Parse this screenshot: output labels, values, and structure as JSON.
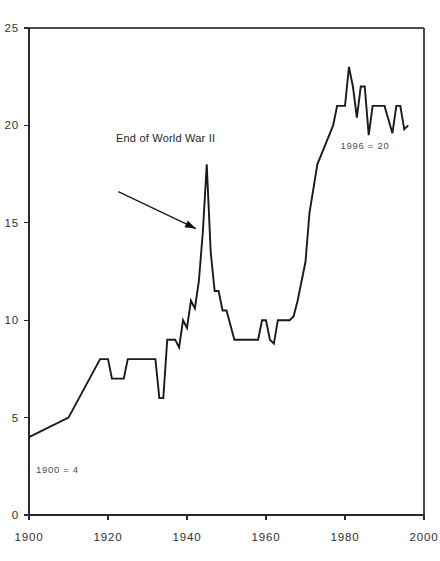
{
  "chart_data": {
    "type": "line",
    "title": "",
    "subtitle": "",
    "xlabel": "",
    "ylabel": "",
    "xlim": [
      1900,
      2000
    ],
    "ylim": [
      0,
      25
    ],
    "grid": false,
    "legend": "none",
    "x_ticks": [
      "1900",
      "1920",
      "1940",
      "1960",
      "1980",
      "2000"
    ],
    "x_tick_values": [
      1900,
      1920,
      1940,
      1960,
      1980,
      2000
    ],
    "y_ticks": [
      "0",
      "5",
      "10",
      "15",
      "20",
      "25"
    ],
    "y_tick_values": [
      0,
      5,
      10,
      15,
      20,
      25
    ],
    "series": [
      {
        "name": "value",
        "x": [
          1900,
          1910,
          1918,
          1920,
          1921,
          1924,
          1925,
          1929,
          1930,
          1932,
          1933,
          1934,
          1935,
          1937,
          1938,
          1939,
          1940,
          1941,
          1942,
          1943,
          1944,
          1945,
          1946,
          1947,
          1948,
          1949,
          1950,
          1952,
          1953,
          1955,
          1956,
          1958,
          1959,
          1960,
          1961,
          1962,
          1963,
          1964,
          1966,
          1967,
          1968,
          1970,
          1971,
          1973,
          1975,
          1977,
          1978,
          1980,
          1981,
          1982,
          1983,
          1984,
          1985,
          1986,
          1987,
          1988,
          1989,
          1990,
          1992,
          1993,
          1994,
          1995,
          1996
        ],
        "y": [
          4,
          5,
          8,
          8,
          7,
          7,
          8,
          8,
          8,
          8,
          6,
          6,
          9,
          9,
          8.6,
          10,
          9.6,
          11,
          10.6,
          12,
          14.5,
          18,
          13.5,
          11.5,
          11.5,
          10.5,
          10.5,
          9,
          9,
          9,
          9,
          9,
          10,
          10,
          9,
          8.8,
          10,
          10,
          10,
          10.2,
          11,
          13,
          15.5,
          18,
          19,
          20,
          21,
          21,
          23,
          22,
          20.4,
          22,
          22,
          19.5,
          21,
          21,
          21,
          21,
          19.6,
          21,
          21,
          19.8,
          20
        ]
      }
    ],
    "annotations": [
      {
        "id": "wwii-annotation",
        "text": "End of World War II",
        "arrow_from": [
          1922.6,
          16.6
        ],
        "arrow_to": [
          1942.3,
          14.7
        ]
      },
      {
        "id": "start-note",
        "text": "1900 = 4"
      },
      {
        "id": "end-note",
        "text": "1996 = 20"
      }
    ]
  }
}
